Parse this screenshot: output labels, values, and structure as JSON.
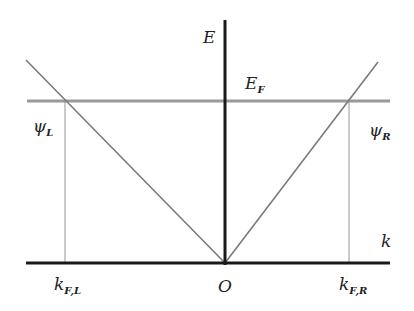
{
  "diagram": {
    "type": "dispersion-diagram",
    "axes": {
      "vertical_label": "E",
      "horizontal_label": "k",
      "origin_label": "O"
    },
    "fermi_level": {
      "label_main": "E",
      "label_sub": "F"
    },
    "states": {
      "left": {
        "label_main": "ψ",
        "label_sub": "L"
      },
      "right": {
        "label_main": "ψ",
        "label_sub": "R"
      }
    },
    "fermi_wavevectors": {
      "left": {
        "label_main": "k",
        "label_sub": "F,L"
      },
      "right": {
        "label_main": "k",
        "label_sub": "F,R"
      }
    },
    "colors": {
      "axis": "#1a1a1a",
      "fermi_line": "#9a9a9a",
      "dispersion": "#7a7a7a",
      "guide": "#8a8a8a"
    }
  }
}
